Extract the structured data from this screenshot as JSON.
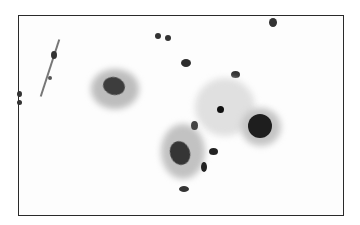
{
  "image": {
    "description": "Grayscale cytology micrograph showing squamous cells with nuclei and scattered small inflammatory cells, within a thin black border",
    "frame": {
      "x": 18,
      "y": 15,
      "width": 326,
      "height": 201,
      "border_color": "#2a2a2a"
    },
    "colors": {
      "background": "#fdfdfd",
      "cytoplasm": "#c8c8c8",
      "nucleus": "#3a3a3a",
      "dark_cell": "#1e1e1e"
    }
  }
}
